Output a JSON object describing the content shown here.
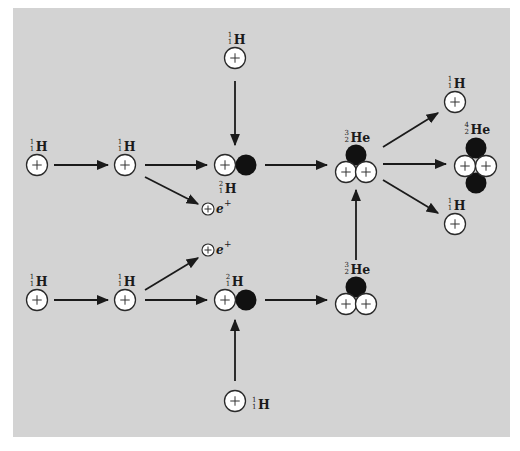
{
  "colors": {
    "page_bg": "#ffffff",
    "panel_bg": "#d3d3d3",
    "proton_fill": "#ffffff",
    "proton_stroke": "#2a2a2a",
    "neutron_fill": "#111111",
    "arrow": "#1a1a1a"
  },
  "panel": {
    "x": 13,
    "y": 8,
    "width": 497,
    "height": 429
  },
  "nuclei": [
    {
      "id": "h1-top-left",
      "name": "hydrogen-1-nucleus",
      "symbol": "H",
      "A": "1",
      "Z": "1",
      "protons": [
        [
          37,
          165
        ]
      ],
      "neutrons": [],
      "label_pos": [
        37,
        148
      ],
      "label_anchor": "middle"
    },
    {
      "id": "h1-top-mid",
      "name": "hydrogen-1-nucleus",
      "symbol": "H",
      "A": "1",
      "Z": "1",
      "protons": [
        [
          125,
          165
        ]
      ],
      "neutrons": [],
      "label_pos": [
        125,
        148
      ],
      "label_anchor": "middle"
    },
    {
      "id": "h1-top-above",
      "name": "hydrogen-1-nucleus",
      "symbol": "H",
      "A": "1",
      "Z": "1",
      "protons": [
        [
          235,
          58
        ]
      ],
      "neutrons": [],
      "label_pos": [
        235,
        41
      ],
      "label_anchor": "middle"
    },
    {
      "id": "h2-top",
      "name": "deuterium-nucleus",
      "symbol": "H",
      "A": "2",
      "Z": "1",
      "protons": [
        [
          225,
          165
        ]
      ],
      "neutrons": [
        [
          246,
          165
        ]
      ],
      "label_pos": [
        226,
        190
      ],
      "label_anchor": "middle"
    },
    {
      "id": "he3-top",
      "name": "helium-3-nucleus",
      "symbol": "He",
      "A": "3",
      "Z": "2",
      "protons": [
        [
          346,
          172
        ],
        [
          366,
          172
        ]
      ],
      "neutrons": [
        [
          356,
          155
        ]
      ],
      "label_pos": [
        356,
        139
      ],
      "label_anchor": "middle"
    },
    {
      "id": "h1-right-top",
      "name": "hydrogen-1-nucleus",
      "symbol": "H",
      "A": "1",
      "Z": "1",
      "protons": [
        [
          455,
          102
        ]
      ],
      "neutrons": [],
      "label_pos": [
        455,
        85
      ],
      "label_anchor": "middle"
    },
    {
      "id": "he4-right",
      "name": "helium-4-nucleus",
      "symbol": "He",
      "A": "4",
      "Z": "2",
      "protons": [
        [
          465,
          166
        ],
        [
          486,
          166
        ]
      ],
      "neutrons": [
        [
          476,
          148
        ],
        [
          476,
          183
        ]
      ],
      "label_pos": [
        476,
        131
      ],
      "label_anchor": "middle"
    },
    {
      "id": "h1-right-bottom",
      "name": "hydrogen-1-nucleus",
      "symbol": "H",
      "A": "1",
      "Z": "1",
      "protons": [
        [
          455,
          224
        ]
      ],
      "neutrons": [],
      "label_pos": [
        455,
        207
      ],
      "label_anchor": "middle"
    },
    {
      "id": "h1-bottom-left",
      "name": "hydrogen-1-nucleus",
      "symbol": "H",
      "A": "1",
      "Z": "1",
      "protons": [
        [
          37,
          300
        ]
      ],
      "neutrons": [],
      "label_pos": [
        37,
        283
      ],
      "label_anchor": "middle"
    },
    {
      "id": "h1-bottom-mid",
      "name": "hydrogen-1-nucleus",
      "symbol": "H",
      "A": "1",
      "Z": "1",
      "protons": [
        [
          125,
          300
        ]
      ],
      "neutrons": [],
      "label_pos": [
        125,
        283
      ],
      "label_anchor": "middle"
    },
    {
      "id": "h2-bottom",
      "name": "deuterium-nucleus",
      "symbol": "H",
      "A": "2",
      "Z": "1",
      "protons": [
        [
          225,
          300
        ]
      ],
      "neutrons": [
        [
          246,
          300
        ]
      ],
      "label_pos": [
        233,
        283
      ],
      "label_anchor": "middle"
    },
    {
      "id": "h1-bottom-below",
      "name": "hydrogen-1-nucleus",
      "symbol": "H",
      "A": "1",
      "Z": "1",
      "protons": [
        [
          235,
          401
        ]
      ],
      "neutrons": [],
      "label_pos": [
        252,
        406
      ],
      "label_anchor": "start"
    },
    {
      "id": "he3-bottom",
      "name": "helium-3-nucleus",
      "symbol": "He",
      "A": "3",
      "Z": "2",
      "protons": [
        [
          346,
          304
        ],
        [
          366,
          304
        ]
      ],
      "neutrons": [
        [
          356,
          287
        ]
      ],
      "label_pos": [
        356,
        271
      ],
      "label_anchor": "middle"
    }
  ],
  "positrons": [
    {
      "id": "positron-top",
      "center": [
        208,
        209
      ],
      "label": "e",
      "charge": "+"
    },
    {
      "id": "positron-bottom",
      "center": [
        208,
        250
      ],
      "label": "e",
      "charge": "+"
    }
  ],
  "arrows": [
    {
      "id": "arrow-h1-to-h1-top",
      "from": [
        54,
        165
      ],
      "to": [
        108,
        165
      ]
    },
    {
      "id": "arrow-h1-to-h2-top",
      "from": [
        145,
        165
      ],
      "to": [
        207,
        165
      ]
    },
    {
      "id": "arrow-h1-to-positron-top",
      "from": [
        145,
        177
      ],
      "to": [
        198,
        204
      ]
    },
    {
      "id": "arrow-h1-above-to-h2",
      "from": [
        235,
        81
      ],
      "to": [
        235,
        145
      ]
    },
    {
      "id": "arrow-h2-to-he3-top",
      "from": [
        265,
        165
      ],
      "to": [
        327,
        165
      ]
    },
    {
      "id": "arrow-he3-to-h1-right-top",
      "from": [
        383,
        147
      ],
      "to": [
        438,
        113
      ]
    },
    {
      "id": "arrow-he3-to-he4",
      "from": [
        383,
        164
      ],
      "to": [
        446,
        164
      ]
    },
    {
      "id": "arrow-he3-to-h1-right-bot",
      "from": [
        383,
        180
      ],
      "to": [
        438,
        213
      ]
    },
    {
      "id": "arrow-h1-to-h1-bottom",
      "from": [
        54,
        300
      ],
      "to": [
        108,
        300
      ]
    },
    {
      "id": "arrow-h1-to-h2-bottom",
      "from": [
        145,
        300
      ],
      "to": [
        207,
        300
      ]
    },
    {
      "id": "arrow-h1-to-positron-bot",
      "from": [
        145,
        290
      ],
      "to": [
        198,
        258
      ]
    },
    {
      "id": "arrow-h1-below-to-h2",
      "from": [
        235,
        381
      ],
      "to": [
        235,
        320
      ]
    },
    {
      "id": "arrow-h2-to-he3-bottom",
      "from": [
        265,
        300
      ],
      "to": [
        327,
        300
      ]
    },
    {
      "id": "arrow-he3-bottom-to-top",
      "from": [
        356,
        260
      ],
      "to": [
        356,
        190
      ]
    }
  ]
}
